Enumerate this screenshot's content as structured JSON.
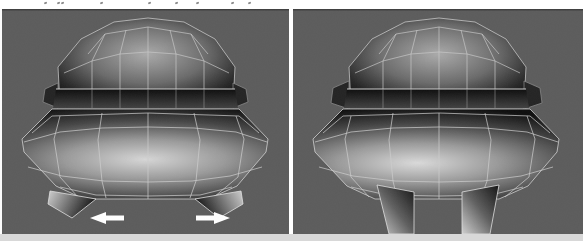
{
  "figure": {
    "kind": "scanned book figure: two 3D-viewport renders of a polygonal head mesh",
    "panels": [
      {
        "id": "before",
        "position": "left",
        "annotation_arrows": [
          "left",
          "right"
        ]
      },
      {
        "id": "after",
        "position": "right",
        "annotation_arrows": []
      }
    ],
    "colors": {
      "page_bg": "#ffffff",
      "panel_bg": "#5c5c5c",
      "panel_top_edge": "#3f3f3f",
      "wireframe": "#cdcdcd",
      "mesh_dark": "#111111",
      "mesh_highlight": "#d6d6d6",
      "divider": "#ffffff",
      "arrow": "#ffffff",
      "bottom_strip": "#d8d8d8",
      "caption_mark": "#8b8b8b"
    },
    "cropped_caption": {
      "note": "illegible descender tips of a cropped text line",
      "marks_x": [
        44,
        57,
        61,
        100,
        148,
        175,
        196,
        231,
        248
      ]
    }
  }
}
